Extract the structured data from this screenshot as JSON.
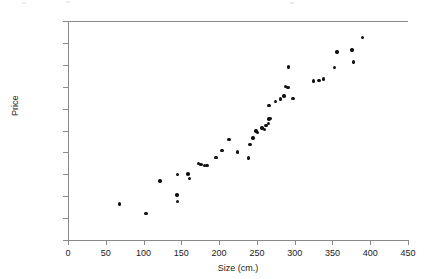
{
  "chart_data": {
    "type": "scatter",
    "title": "",
    "xlabel": "Size (cm.)",
    "ylabel": "Price",
    "xlim": [
      0,
      450
    ],
    "ylim": [
      0,
      50
    ],
    "grid": false,
    "legend": false,
    "xticks": [
      "0",
      "50",
      "100",
      "150",
      "200",
      "250",
      "300",
      "350",
      "400",
      "450"
    ],
    "xtick_values": [
      0,
      50,
      100,
      150,
      200,
      250,
      300,
      350,
      400,
      450
    ],
    "yticks": [
      "$0.00",
      "$5.00",
      "$10.00",
      "$15.00",
      "$20.00",
      "$25.00",
      "$30.00",
      "$35.00",
      "$40.00",
      "$45.00",
      "$50.00"
    ],
    "ytick_values": [
      0,
      5,
      10,
      15,
      20,
      25,
      30,
      35,
      40,
      45,
      50
    ],
    "marker": "filled-circle",
    "marker_color": "#111111",
    "axis_color": "#8a8a8a",
    "points": [
      {
        "x": 68,
        "y": 8.2
      },
      {
        "x": 103,
        "y": 6.1
      },
      {
        "x": 122,
        "y": 13.5
      },
      {
        "x": 144,
        "y": 10.3
      },
      {
        "x": 145,
        "y": 8.8
      },
      {
        "x": 145,
        "y": 14.9
      },
      {
        "x": 159,
        "y": 15.1
      },
      {
        "x": 161,
        "y": 14.0
      },
      {
        "x": 173,
        "y": 17.4
      },
      {
        "x": 176,
        "y": 17.3
      },
      {
        "x": 181,
        "y": 17.0
      },
      {
        "x": 184,
        "y": 17.0
      },
      {
        "x": 196,
        "y": 18.9
      },
      {
        "x": 204,
        "y": 20.5
      },
      {
        "x": 213,
        "y": 23.0
      },
      {
        "x": 224,
        "y": 20.1
      },
      {
        "x": 239,
        "y": 18.7
      },
      {
        "x": 241,
        "y": 21.8
      },
      {
        "x": 245,
        "y": 23.3
      },
      {
        "x": 249,
        "y": 24.9
      },
      {
        "x": 251,
        "y": 24.6
      },
      {
        "x": 257,
        "y": 25.6
      },
      {
        "x": 260,
        "y": 25.2
      },
      {
        "x": 262,
        "y": 26.2
      },
      {
        "x": 265,
        "y": 26.6
      },
      {
        "x": 266,
        "y": 27.6
      },
      {
        "x": 268,
        "y": 27.8
      },
      {
        "x": 266,
        "y": 30.7
      },
      {
        "x": 275,
        "y": 31.6
      },
      {
        "x": 281,
        "y": 32.2
      },
      {
        "x": 286,
        "y": 32.9
      },
      {
        "x": 288,
        "y": 35.1
      },
      {
        "x": 291,
        "y": 34.8
      },
      {
        "x": 292,
        "y": 39.5
      },
      {
        "x": 298,
        "y": 32.3
      },
      {
        "x": 325,
        "y": 36.3
      },
      {
        "x": 332,
        "y": 36.4
      },
      {
        "x": 338,
        "y": 36.8
      },
      {
        "x": 353,
        "y": 39.4
      },
      {
        "x": 356,
        "y": 42.9
      },
      {
        "x": 376,
        "y": 43.4
      },
      {
        "x": 378,
        "y": 40.6
      },
      {
        "x": 390,
        "y": 46.3
      }
    ]
  }
}
